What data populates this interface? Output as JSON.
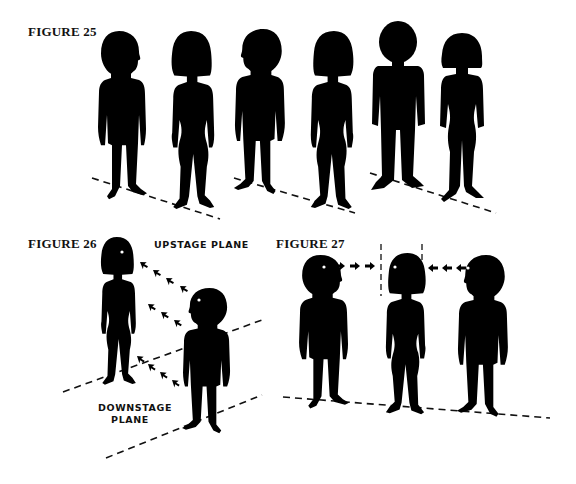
{
  "figures": [
    {
      "id": "figure-25",
      "label": "FIGURE 25",
      "description": "Three pairs of silhouettes (man and woman) standing on dashed floor lines",
      "figures_count": 6
    },
    {
      "id": "figure-26",
      "label": "FIGURE 26",
      "upstage_label": "UPSTAGE PLANE",
      "downstage_label_line1": "DOWNSTAGE",
      "downstage_label_line2": "PLANE",
      "description": "Woman on upstage plane, man on downstage plane, arrows indicating sightlines between them"
    },
    {
      "id": "figure-27",
      "label": "FIGURE 27",
      "description": "Woman centered between two men; arrows point from each man toward the woman within a dashed frame"
    }
  ],
  "colors": {
    "ink": "#000000",
    "background": "#ffffff"
  }
}
